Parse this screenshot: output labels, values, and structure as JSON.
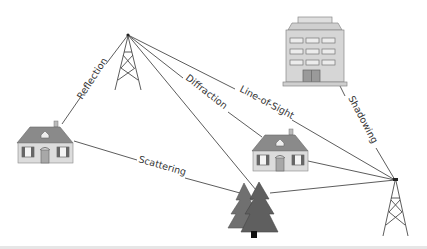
{
  "diagram": {
    "type": "radio-propagation-illustration",
    "labels": {
      "reflection": "Reflection",
      "diffraction": "Diffraction",
      "line_of_sight": "Line-of-Sight",
      "shadowing": "Shadowing",
      "scattering": "Scattering"
    },
    "nodes": [
      {
        "id": "tower-left",
        "icon": "transmission-tower-icon"
      },
      {
        "id": "tower-right",
        "icon": "transmission-tower-icon"
      },
      {
        "id": "house-left",
        "icon": "house-icon"
      },
      {
        "id": "house-center",
        "icon": "house-icon"
      },
      {
        "id": "office-building",
        "icon": "building-icon"
      },
      {
        "id": "trees",
        "icon": "tree-icon"
      }
    ],
    "paths": [
      {
        "from": "tower-left",
        "to": "house-left",
        "label": "Reflection"
      },
      {
        "from": "tower-left",
        "to": "house-center",
        "label": "Diffraction"
      },
      {
        "from": "tower-left",
        "to": "tower-right",
        "label": "Line-of-Sight"
      },
      {
        "from": "tower-left",
        "to": "trees",
        "label": ""
      },
      {
        "from": "office-building",
        "to": "tower-right",
        "label": "Shadowing"
      },
      {
        "from": "house-left",
        "to": "trees",
        "label": "Scattering"
      },
      {
        "from": "house-center",
        "to": "tower-right",
        "label": ""
      },
      {
        "from": "trees",
        "to": "tower-right",
        "label": ""
      }
    ],
    "colors": {
      "line": "#444444",
      "roof": "#8a8a8a",
      "wall": "#dcdcdc",
      "tree": "#6b6b6b",
      "building": "#d4d4d4"
    }
  }
}
